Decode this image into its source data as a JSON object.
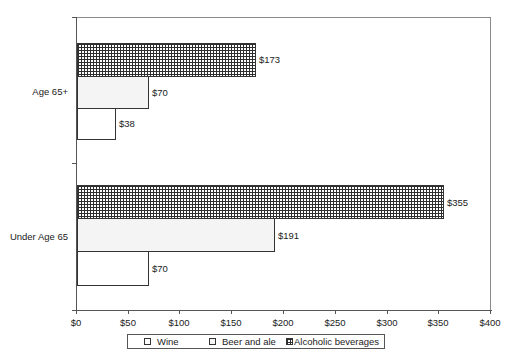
{
  "chart_data": {
    "type": "bar",
    "orientation": "horizontal",
    "title": "",
    "xlabel": "",
    "ylabel": "",
    "categories": [
      "Under Age 65",
      "Age 65+"
    ],
    "series": [
      {
        "name": "Wine",
        "values": [
          70,
          38
        ],
        "labels": [
          "$70",
          "$38"
        ],
        "pattern": "white"
      },
      {
        "name": "Beer and ale",
        "values": [
          191,
          70
        ],
        "labels": [
          "$191",
          "$70"
        ],
        "pattern": "dotted"
      },
      {
        "name": "Alcoholic beverages",
        "values": [
          355,
          173
        ],
        "labels": [
          "$355",
          "$173"
        ],
        "pattern": "crosshatch"
      }
    ],
    "xlim": [
      0,
      400
    ],
    "x_ticks": [
      0,
      50,
      100,
      150,
      200,
      250,
      300,
      350,
      400
    ],
    "x_tick_labels": [
      "$0",
      "$50",
      "$100",
      "$150",
      "$200",
      "$250",
      "$300",
      "$350",
      "$400"
    ],
    "grid": false,
    "legend_position": "bottom"
  },
  "colors": {
    "axis": "#555555",
    "bar_border": "#333333",
    "crosshatch": "#2e2e2e",
    "dots": "#8c8c8c"
  },
  "legend": {
    "items": [
      "Wine",
      "Beer and ale",
      "Alcoholic beverages"
    ]
  }
}
